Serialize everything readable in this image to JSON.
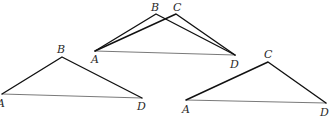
{
  "diagram": {
    "colors": {
      "edge": "#111111",
      "base": "#7a7a7a",
      "label": "#2a2a2a",
      "background": "#ffffff"
    },
    "figures": [
      {
        "name": "combined",
        "labels": {
          "A": "A",
          "B": "B",
          "C": "C",
          "D": "D"
        },
        "points": {
          "A": [
            95,
            51
          ],
          "B": [
            156,
            14
          ],
          "C": [
            176,
            14
          ],
          "D": [
            235,
            55
          ]
        }
      },
      {
        "name": "triangle-ABD",
        "labels": {
          "A": "A",
          "B": "B",
          "D": "D"
        },
        "points": {
          "A": [
            2,
            94
          ],
          "B": [
            62,
            57
          ],
          "D": [
            142,
            98
          ]
        }
      },
      {
        "name": "triangle-ACD",
        "labels": {
          "A": "A",
          "C": "C",
          "D": "D"
        },
        "points": {
          "A": [
            186,
            100
          ],
          "C": [
            268,
            62
          ],
          "D": [
            326,
            103
          ]
        }
      }
    ]
  }
}
